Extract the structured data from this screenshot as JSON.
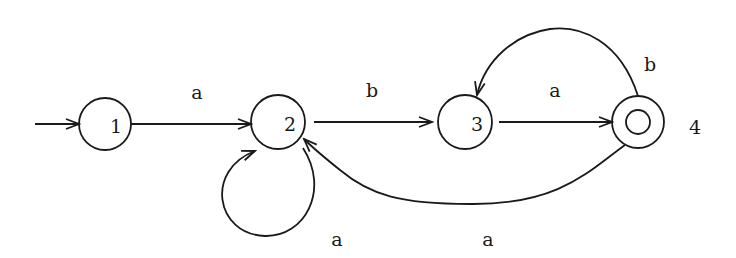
{
  "automaton": {
    "states": [
      {
        "id": "1",
        "label": "1",
        "initial": true,
        "accepting": false
      },
      {
        "id": "2",
        "label": "2",
        "initial": false,
        "accepting": false
      },
      {
        "id": "3",
        "label": "3",
        "initial": false,
        "accepting": false
      },
      {
        "id": "4",
        "label": "4",
        "initial": false,
        "accepting": true
      }
    ],
    "transitions": [
      {
        "from": "1",
        "to": "2",
        "symbol": "a"
      },
      {
        "from": "2",
        "to": "3",
        "symbol": "b"
      },
      {
        "from": "3",
        "to": "4",
        "symbol": "a"
      },
      {
        "from": "4",
        "to": "3",
        "symbol": "b"
      },
      {
        "from": "2",
        "to": "2",
        "symbol": "a"
      },
      {
        "from": "4",
        "to": "2",
        "symbol": "a"
      }
    ]
  }
}
